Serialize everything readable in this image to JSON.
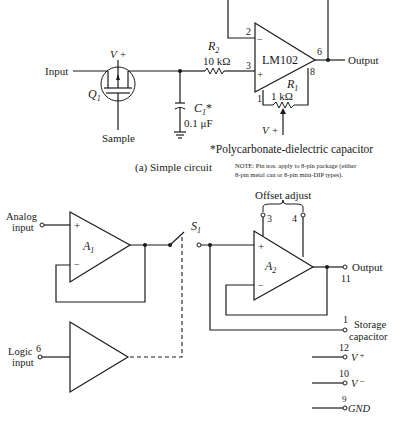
{
  "circuit_a": {
    "opamp_label": "LM102",
    "input_label": "Input",
    "output_label": "Output",
    "transistor_label": "Q",
    "transistor_sub": "1",
    "vplus_label": "V +",
    "sample_label": "Sample",
    "capacitor_label": "C",
    "capacitor_sub": "1",
    "capacitor_star": "*",
    "capacitor_value": "0.1 μF",
    "r2_label": "R",
    "r2_sub": "2",
    "r2_value": "10 kΩ",
    "r1_label": "R",
    "r1_sub": "1",
    "r1_value": "1 kΩ",
    "r1_vplus_label": "V +",
    "pin_minus": "2",
    "pin_plus": "3",
    "pin_out": "6",
    "pin_8": "8",
    "pin_1": "1",
    "plus_sign": "+",
    "minus_sign": "−",
    "footnote": "*Polycarbonate-dielectric capacitor",
    "caption": "(a) Simple circuit",
    "note_line1": "NOTE:    Pin nos. apply to 8-pin package (either",
    "note_line2": "8-pin metal can or 8-pin mini-DIP types)."
  },
  "circuit_b": {
    "offset_label": "Offset adjust",
    "offset_pin_left": "3",
    "offset_pin_right": "4",
    "a1_label": "A",
    "a1_sub": "1",
    "a2_label": "A",
    "a2_sub": "2",
    "analog_input_line1": "Analog",
    "analog_input_line2": "input",
    "logic_input_line1": "Logic",
    "logic_input_line2": "input",
    "logic_pin": "6",
    "switch_label": "S",
    "switch_sub": "1",
    "output_label": "Output",
    "output_pin": "11",
    "storage_pin": "1",
    "storage_line1": "Storage",
    "storage_line2": "capacitor",
    "vplus_pin": "12",
    "vplus_label": "V",
    "vplus_sign": "+",
    "vminus_pin": "10",
    "vminus_label": "V",
    "vminus_sign": "−",
    "gnd_pin": "9",
    "gnd_label": "GND",
    "plus_sign": "+",
    "minus_sign": "−"
  }
}
